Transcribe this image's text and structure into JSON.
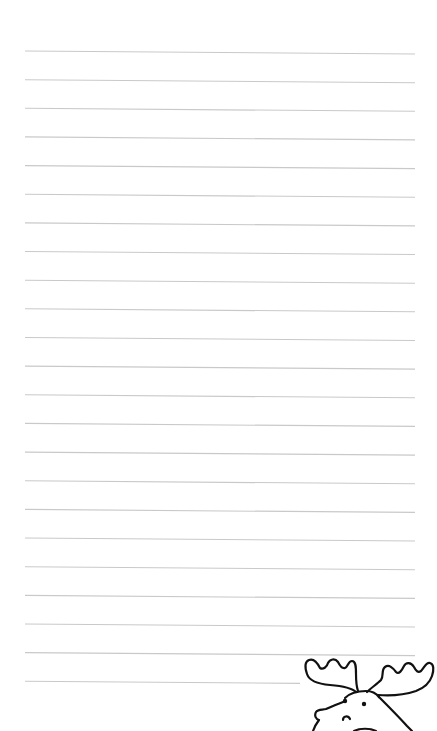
{
  "page": {
    "type": "lined-notepaper",
    "background_color": "#ffffff",
    "line_color": "#c9c9c9",
    "line_count": 23,
    "first_line_y": 51,
    "line_spacing": 28.65,
    "line_left_x": 25,
    "line_right_x": 415,
    "line_right_slope_px": 3,
    "last_line_right_x": 300
  },
  "decoration": {
    "icon": "moose-head-icon",
    "stroke_color": "#111111",
    "position": "bottom-right"
  }
}
